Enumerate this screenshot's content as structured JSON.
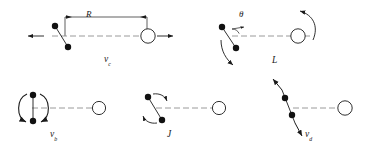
{
  "figure": {
    "background_color": "#ffffff",
    "stroke_color": "#1a1a1a",
    "dashed_axis_color": "#8a8a8a",
    "filled_dot_color": "#111111",
    "open_circle_fill": "#ffffff"
  },
  "labels": {
    "separation": "R",
    "theta": "θ",
    "panel_top_left": {
      "symbol": "v",
      "subscript": "c"
    },
    "panel_top_right": {
      "symbol": "L",
      "subscript": ""
    },
    "panel_bottom_left": {
      "symbol": "v",
      "subscript": "b"
    },
    "panel_bottom_middle": {
      "symbol": "J",
      "subscript": ""
    },
    "panel_bottom_right": {
      "symbol": "v",
      "subscript": "d"
    }
  },
  "panels": [
    {
      "id": "panel-vc",
      "label": "v_c",
      "description": "Tilted dumbbell of two filled dots crossing a dashed horizontal axis; open circle at right; straight translation arrows pointing outward left and right; dimension line R spanning the separation.",
      "annotations": [
        "R",
        "v_c"
      ],
      "arrow_type": "straight-translation",
      "arrow_directions": [
        "left",
        "right"
      ],
      "has_dimension_line": true,
      "has_angle_arc": false
    },
    {
      "id": "panel-L",
      "label": "L",
      "description": "Tilted dumbbell with angle theta measured from the dashed axis; curved rotation arrow sweeping below the dumbbell and a curved rotation arrow above the open circle.",
      "annotations": [
        "θ",
        "L"
      ],
      "arrow_type": "curved-rotation",
      "arrow_directions": [
        "counterclockwise-lower",
        "counterclockwise-upper-right"
      ],
      "has_dimension_line": false,
      "has_angle_arc": true
    },
    {
      "id": "panel-vb",
      "label": "v_b",
      "description": "Two filled dots stacked vertically joined by a short bar, enclosed by two facing arcs with arrowheads forming a breathing/rotational loop; open circle at right on dashed axis.",
      "annotations": [
        "v_b"
      ],
      "arrow_type": "curved-loop",
      "arrow_directions": [
        "left-arc",
        "right-arc"
      ],
      "has_dimension_line": false,
      "has_angle_arc": false
    },
    {
      "id": "panel-J",
      "label": "J",
      "description": "Tilted dumbbell with two short curved arrows indicating internal rotation, one off the upper dot and one off the lower dot; open circle at right on dashed axis.",
      "annotations": [
        "J"
      ],
      "arrow_type": "curved-short",
      "arrow_directions": [
        "upper-right",
        "lower-left"
      ],
      "has_dimension_line": false,
      "has_angle_arc": false
    },
    {
      "id": "panel-vd",
      "label": "v_d",
      "description": "Two filled dots on a steeply tilted line with straight arrows at both ends pointing outward along the line; open circle at right on dashed axis.",
      "annotations": [
        "v_d"
      ],
      "arrow_type": "straight-stretch",
      "arrow_directions": [
        "up-right",
        "down-left"
      ],
      "has_dimension_line": false,
      "has_angle_arc": false
    }
  ]
}
